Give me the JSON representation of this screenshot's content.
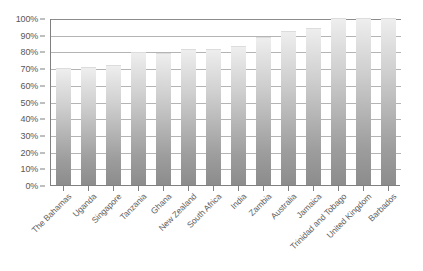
{
  "chart_data": {
    "type": "bar",
    "title": "",
    "subtitle": "",
    "xlabel": "",
    "ylabel": "",
    "ylim": [
      0,
      100
    ],
    "y_tick_labels": [
      "0%",
      "10%",
      "20%",
      "30%",
      "40%",
      "50%",
      "60%",
      "70%",
      "80%",
      "90%",
      "100%"
    ],
    "y_tick_values": [
      0,
      10,
      20,
      30,
      40,
      50,
      60,
      70,
      80,
      90,
      100
    ],
    "grid": "horizontal",
    "legend": "none",
    "categories": [
      "The Bahamas",
      "Uganda",
      "Singapore",
      "Tanzania",
      "Ghana",
      "New Zealand",
      "South Africa",
      "India",
      "Zambia",
      "Australia",
      "Jamaica",
      "Trinidad and Tobago",
      "United Kingdom",
      "Barbados"
    ],
    "values": [
      70,
      70.5,
      72,
      79.5,
      79,
      81.5,
      81.5,
      83,
      88.5,
      92.5,
      94,
      100,
      100,
      100
    ],
    "bar_color_top": "#eeeeee",
    "bar_color_bottom": "#8c8c8c",
    "gridline_color": "#b4b4b4",
    "axis_color": "#808080",
    "background_color": "#ffffff"
  }
}
